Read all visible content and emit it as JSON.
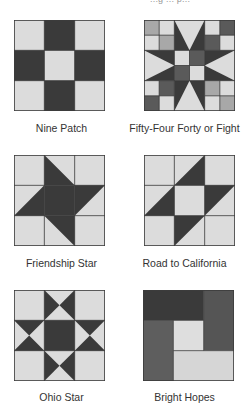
{
  "header": {
    "partial_text": "...g ... p..."
  },
  "colors": {
    "light": "#dcdcdc",
    "dark": "#3a3a3a",
    "medium_dark": "#555555",
    "medium": "#6b6b6b",
    "medium_light": "#a0a0a0",
    "grid_line": "#3c3c3c",
    "label_text": "#333333"
  },
  "blocks": [
    {
      "name": "Nine Patch",
      "id": "nine-patch"
    },
    {
      "name": "Fifty-Four Forty or Fight",
      "id": "fifty-four-forty-or-fight"
    },
    {
      "name": "Friendship Star",
      "id": "friendship-star"
    },
    {
      "name": "Road to California",
      "id": "road-to-california"
    },
    {
      "name": "Ohio Star",
      "id": "ohio-star"
    },
    {
      "name": "Bright Hopes",
      "id": "bright-hopes"
    }
  ]
}
